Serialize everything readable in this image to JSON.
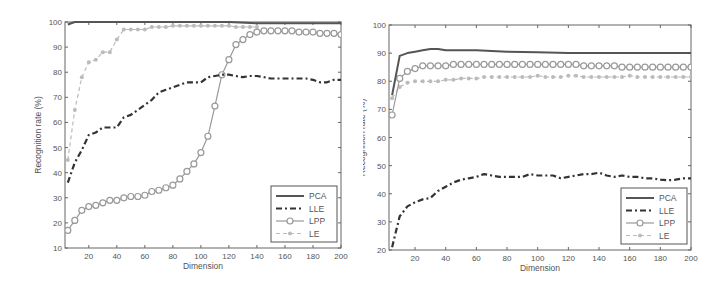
{
  "chart_data": [
    {
      "type": "line",
      "xlabel": "Dimension",
      "ylabel": "Recognition rate (%)",
      "xlim": [
        3,
        200
      ],
      "ylim": [
        10,
        100
      ],
      "xticks": [
        20,
        40,
        60,
        80,
        100,
        120,
        140,
        160,
        180,
        200
      ],
      "yticks": [
        10,
        20,
        30,
        40,
        50,
        60,
        70,
        80,
        90,
        100
      ],
      "grid": false,
      "legend_position": "lower right",
      "legend": [
        "PCA",
        "LLE",
        "LPP",
        "LE"
      ],
      "series": [
        {
          "name": "PCA",
          "style": "solid",
          "color": "#555555",
          "x": [
            5,
            10,
            15,
            20,
            40,
            60,
            80,
            100,
            120,
            140,
            160,
            180,
            200
          ],
          "y": [
            99,
            100,
            100,
            100,
            100,
            100,
            100,
            100,
            100,
            99.5,
            99.5,
            99.5,
            99.5
          ]
        },
        {
          "name": "LLE",
          "style": "dashdot",
          "color": "#333333",
          "x": [
            5,
            10,
            15,
            20,
            25,
            30,
            35,
            40,
            45,
            50,
            55,
            60,
            65,
            70,
            75,
            80,
            85,
            90,
            95,
            100,
            105,
            110,
            115,
            120,
            125,
            130,
            135,
            140,
            145,
            150,
            155,
            160,
            165,
            170,
            175,
            180,
            185,
            190,
            195,
            200
          ],
          "y": [
            36,
            44,
            49,
            55,
            56,
            58,
            58,
            58,
            62,
            63,
            65,
            67,
            69,
            72,
            73,
            74,
            75,
            76,
            76,
            76,
            78,
            78.5,
            79,
            79,
            78.5,
            78,
            78.5,
            78.5,
            78,
            77.5,
            77.5,
            77.5,
            77.5,
            77.5,
            77.5,
            77,
            76,
            76,
            77,
            77
          ]
        },
        {
          "name": "LPP",
          "style": "solid-circle",
          "color": "#999999",
          "x": [
            5,
            10,
            15,
            20,
            25,
            30,
            35,
            40,
            45,
            50,
            55,
            60,
            65,
            70,
            75,
            80,
            85,
            90,
            95,
            100,
            105,
            110,
            115,
            120,
            125,
            130,
            135,
            140,
            145,
            150,
            155,
            160,
            165,
            170,
            175,
            180,
            185,
            190,
            195,
            200
          ],
          "y": [
            17,
            21,
            25,
            26.5,
            27,
            28,
            29,
            29,
            30,
            30.5,
            30.5,
            31,
            32.5,
            33,
            34,
            35,
            37.5,
            40.5,
            43.5,
            48,
            54.5,
            66.5,
            79,
            85,
            91,
            93,
            95,
            96,
            96.5,
            96.5,
            96.5,
            96.5,
            96.5,
            96,
            96,
            96,
            95.5,
            95.5,
            95.5,
            95
          ]
        },
        {
          "name": "LE",
          "style": "dashed-star",
          "color": "#bbbbbb",
          "x": [
            5,
            10,
            15,
            20,
            25,
            30,
            35,
            40,
            45,
            50,
            55,
            60,
            65,
            70,
            75,
            80,
            85,
            90,
            95,
            100,
            105,
            110,
            115,
            120,
            125,
            130,
            135,
            140
          ],
          "y": [
            45,
            65,
            78,
            84,
            85,
            88,
            88,
            93,
            97,
            97,
            97,
            97,
            98,
            98,
            98,
            98.5,
            98.5,
            98.5,
            98.5,
            98.5,
            98.5,
            98.5,
            98.5,
            98.5,
            98,
            98,
            98,
            98
          ]
        }
      ]
    },
    {
      "type": "line",
      "xlabel": "Dimension",
      "ylabel": "Recognition rate (%)",
      "xlim": [
        3,
        200
      ],
      "ylim": [
        20,
        100
      ],
      "xticks": [
        20,
        40,
        60,
        80,
        100,
        120,
        140,
        160,
        180,
        200
      ],
      "yticks": [
        20,
        30,
        40,
        50,
        60,
        70,
        80,
        90,
        100
      ],
      "grid": false,
      "legend_position": "lower right",
      "legend": [
        "PCA",
        "LLE",
        "LPP",
        "LE"
      ],
      "series": [
        {
          "name": "PCA",
          "style": "solid",
          "color": "#555555",
          "x": [
            5,
            10,
            15,
            20,
            25,
            30,
            35,
            40,
            60,
            80,
            100,
            120,
            140,
            160,
            180,
            200
          ],
          "y": [
            75,
            89,
            90,
            90.5,
            91,
            91.5,
            91.5,
            91,
            91,
            90.5,
            90.3,
            90,
            90,
            90,
            90,
            90
          ]
        },
        {
          "name": "LLE",
          "style": "dashdot",
          "color": "#333333",
          "x": [
            5,
            10,
            15,
            20,
            25,
            30,
            35,
            40,
            45,
            50,
            55,
            60,
            65,
            70,
            75,
            80,
            85,
            90,
            95,
            100,
            105,
            110,
            115,
            120,
            125,
            130,
            135,
            140,
            145,
            150,
            155,
            160,
            165,
            170,
            175,
            180,
            185,
            190,
            195,
            200
          ],
          "y": [
            21,
            32,
            35.5,
            37,
            38,
            38.5,
            41,
            42.5,
            44,
            45,
            45.5,
            46,
            47,
            46.5,
            46,
            46,
            46,
            46,
            47,
            46.5,
            46.5,
            46.5,
            45.5,
            46,
            46.5,
            47,
            47,
            47.5,
            46.5,
            46,
            46.5,
            46,
            46,
            45.5,
            45.5,
            45,
            44.8,
            45,
            45.5,
            45.5
          ]
        },
        {
          "name": "LPP",
          "style": "solid-circle",
          "color": "#999999",
          "x": [
            5,
            10,
            15,
            20,
            25,
            30,
            35,
            40,
            45,
            50,
            55,
            60,
            65,
            70,
            75,
            80,
            85,
            90,
            95,
            100,
            105,
            110,
            115,
            120,
            125,
            130,
            135,
            140,
            145,
            150,
            155,
            160,
            165,
            170,
            175,
            180,
            185,
            190,
            195,
            200
          ],
          "y": [
            68,
            81,
            83.5,
            84.5,
            85.5,
            85.5,
            85.5,
            85.5,
            86,
            86,
            86,
            86,
            86,
            86,
            86,
            86,
            86,
            86,
            86,
            86,
            86,
            86,
            86,
            86,
            86,
            85.5,
            85.5,
            85.5,
            85.5,
            85.5,
            85,
            85,
            85,
            85,
            85,
            85,
            85,
            85,
            85,
            85
          ]
        },
        {
          "name": "LE",
          "style": "dashed-star",
          "color": "#bbbbbb",
          "x": [
            5,
            10,
            15,
            20,
            25,
            30,
            35,
            40,
            45,
            50,
            55,
            60,
            65,
            70,
            75,
            80,
            85,
            90,
            95,
            100,
            105,
            110,
            115,
            120,
            125,
            130,
            135,
            140,
            145,
            150,
            155,
            160,
            165,
            170,
            175,
            180,
            185,
            190,
            195,
            200
          ],
          "y": [
            74,
            78,
            79.5,
            80,
            80,
            80,
            80,
            80.5,
            80.5,
            81,
            81,
            81,
            81.5,
            81.5,
            81.5,
            81.5,
            81.5,
            81.5,
            81.5,
            82,
            81.5,
            81.5,
            81.5,
            82,
            82,
            81.5,
            81.5,
            81.5,
            81.5,
            81.5,
            81.5,
            82,
            81.5,
            81.5,
            81.5,
            81.5,
            81.5,
            81.5,
            81.5,
            81.5
          ]
        }
      ]
    }
  ]
}
